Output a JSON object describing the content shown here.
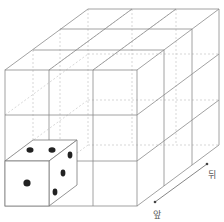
{
  "diagram": {
    "grid_size": [
      3,
      3,
      3
    ],
    "die": {
      "position": "front-bottom-left",
      "faces": {
        "front": 1,
        "top": 2,
        "right": 3
      }
    },
    "arrow": {
      "front_label": "앞",
      "back_label": "뒤"
    },
    "colors": {
      "line": "#8a8a8a",
      "hidden_line": "#bdbdbd",
      "pip": "#222222"
    }
  }
}
